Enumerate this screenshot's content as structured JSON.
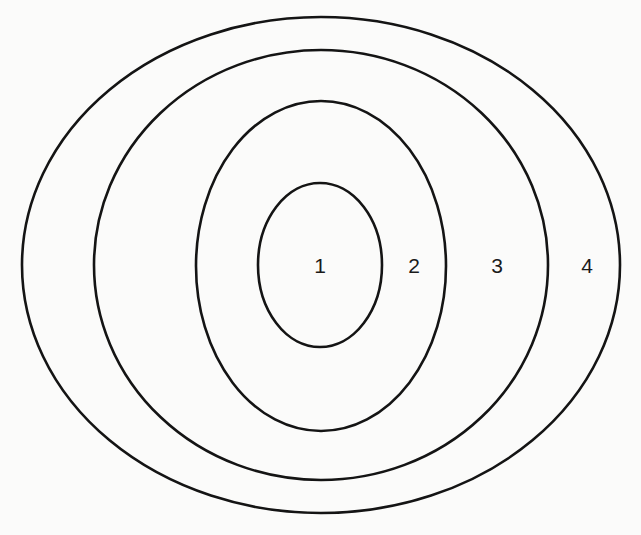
{
  "diagram": {
    "type": "nested-ellipses",
    "rings": [
      {
        "id": 1,
        "label": "1"
      },
      {
        "id": 2,
        "label": "2"
      },
      {
        "id": 3,
        "label": "3"
      },
      {
        "id": 4,
        "label": "4"
      }
    ],
    "colors": {
      "stroke": "#141414",
      "text": "#1a1a1a",
      "background": "#fbfbfa"
    }
  }
}
